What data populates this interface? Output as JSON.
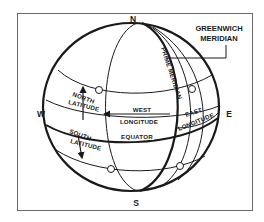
{
  "diagram": {
    "compass": {
      "north": "N",
      "south": "S",
      "west": "W",
      "east": "E"
    },
    "callout": {
      "line1": "GREENWICH",
      "line2": "MERIDIAN"
    },
    "labels": {
      "prime_meridian": "PRIME MERIDIAN",
      "north_latitude_1": "NORTH",
      "north_latitude_2": "LATITUDE",
      "south_latitude_1": "SOUTH",
      "south_latitude_2": "LATITUDE",
      "west_longitude_1": "WEST",
      "west_longitude_2": "LONGITUDE",
      "east_longitude_1": "EAST",
      "east_longitude_2": "LONGITUDE",
      "equator": "EQUATOR"
    },
    "colors": {
      "line": "#1a1a1a",
      "frame": "#6a6a6a",
      "background": "#ffffff"
    }
  }
}
